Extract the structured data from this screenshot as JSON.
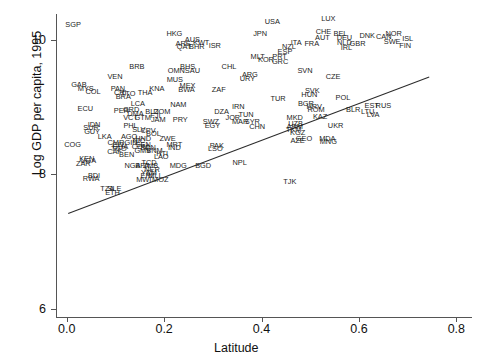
{
  "axes": {
    "xlabel": "Latitude",
    "ylabel": "Log GDP per capita, 1995",
    "xticks": [
      "0.0",
      "0.2",
      "0.4",
      "0.6",
      "0.8"
    ],
    "xtick_values": [
      0.0,
      0.2,
      0.4,
      0.6,
      0.8
    ],
    "yticks": [
      "6",
      "8",
      "10"
    ],
    "ytick_values": [
      6,
      8,
      10
    ],
    "xlim": [
      -0.02,
      0.83
    ],
    "ylim": [
      5.88,
      10.38
    ]
  },
  "chart_data": {
    "type": "scatter",
    "title": "",
    "xlabel": "Latitude",
    "ylabel": "Log GDP per capita, 1995",
    "xlim": [
      -0.02,
      0.83
    ],
    "ylim": [
      5.88,
      10.38
    ],
    "grid": false,
    "legend": null,
    "marker_style": "text-label",
    "annotation_note": "Each point is rendered as its 3-letter ISO country code instead of a marker.",
    "trendline": {
      "type": "linear-fit",
      "x_start": 0.003,
      "y_start": 7.42,
      "x_end": 0.745,
      "y_end": 9.45
    },
    "points": [
      {
        "label": "SGP",
        "x": 0.013,
        "y": 10.22
      },
      {
        "label": "HKG",
        "x": 0.221,
        "y": 10.09
      },
      {
        "label": "USA",
        "x": 0.422,
        "y": 10.26
      },
      {
        "label": "LUX",
        "x": 0.537,
        "y": 10.31
      },
      {
        "label": "CHE",
        "x": 0.527,
        "y": 10.11
      },
      {
        "label": "BEL",
        "x": 0.562,
        "y": 10.09
      },
      {
        "label": "NOR",
        "x": 0.671,
        "y": 10.09
      },
      {
        "label": "AUS",
        "x": 0.258,
        "y": 9.99
      },
      {
        "label": "JPN",
        "x": 0.397,
        "y": 10.08
      },
      {
        "label": "AUT",
        "x": 0.525,
        "y": 10.02
      },
      {
        "label": "DEU",
        "x": 0.57,
        "y": 10.02
      },
      {
        "label": "DNK",
        "x": 0.617,
        "y": 10.05
      },
      {
        "label": "CAN",
        "x": 0.651,
        "y": 10.04
      },
      {
        "label": "ISL",
        "x": 0.7,
        "y": 10.01
      },
      {
        "label": "ARE",
        "x": 0.239,
        "y": 9.94
      },
      {
        "label": "KWT",
        "x": 0.276,
        "y": 9.95
      },
      {
        "label": "ITA",
        "x": 0.471,
        "y": 9.95
      },
      {
        "label": "FRA",
        "x": 0.503,
        "y": 9.94
      },
      {
        "label": "NLD",
        "x": 0.57,
        "y": 9.95
      },
      {
        "label": "GBR",
        "x": 0.597,
        "y": 9.93
      },
      {
        "label": "SWE",
        "x": 0.668,
        "y": 9.96
      },
      {
        "label": "FIN",
        "x": 0.695,
        "y": 9.91
      },
      {
        "label": "QAT",
        "x": 0.241,
        "y": 9.89
      },
      {
        "label": "BHR",
        "x": 0.267,
        "y": 9.89
      },
      {
        "label": "ISR",
        "x": 0.304,
        "y": 9.9
      },
      {
        "label": "NZL",
        "x": 0.456,
        "y": 9.89
      },
      {
        "label": "IRL",
        "x": 0.574,
        "y": 9.87
      },
      {
        "label": "ESP",
        "x": 0.448,
        "y": 9.81
      },
      {
        "label": "MLT",
        "x": 0.392,
        "y": 9.74
      },
      {
        "label": "PRT",
        "x": 0.437,
        "y": 9.74
      },
      {
        "label": "KOR",
        "x": 0.409,
        "y": 9.7
      },
      {
        "label": "GRC",
        "x": 0.438,
        "y": 9.67
      },
      {
        "label": "BRB",
        "x": 0.144,
        "y": 9.6
      },
      {
        "label": "BHS",
        "x": 0.248,
        "y": 9.59
      },
      {
        "label": "CHL",
        "x": 0.333,
        "y": 9.59
      },
      {
        "label": "SVN",
        "x": 0.489,
        "y": 9.54
      },
      {
        "label": "CZE",
        "x": 0.547,
        "y": 9.44
      },
      {
        "label": "OMN",
        "x": 0.225,
        "y": 9.54
      },
      {
        "label": "SAU",
        "x": 0.258,
        "y": 9.54
      },
      {
        "label": "ARG",
        "x": 0.376,
        "y": 9.47
      },
      {
        "label": "URY",
        "x": 0.371,
        "y": 9.41
      },
      {
        "label": "VEN",
        "x": 0.099,
        "y": 9.45
      },
      {
        "label": "MUS",
        "x": 0.222,
        "y": 9.4
      },
      {
        "label": "GAB",
        "x": 0.025,
        "y": 9.32
      },
      {
        "label": "MYS",
        "x": 0.039,
        "y": 9.27
      },
      {
        "label": "COL",
        "x": 0.054,
        "y": 9.22
      },
      {
        "label": "PAN",
        "x": 0.105,
        "y": 9.26
      },
      {
        "label": "MEX",
        "x": 0.248,
        "y": 9.31
      },
      {
        "label": "BWA",
        "x": 0.246,
        "y": 9.25
      },
      {
        "label": "KNA",
        "x": 0.185,
        "y": 9.26
      },
      {
        "label": "ZAF",
        "x": 0.312,
        "y": 9.25
      },
      {
        "label": "SVK",
        "x": 0.504,
        "y": 9.24
      },
      {
        "label": "HUN",
        "x": 0.498,
        "y": 9.18
      },
      {
        "label": "CRI",
        "x": 0.11,
        "y": 9.2
      },
      {
        "label": "TTO",
        "x": 0.126,
        "y": 9.19
      },
      {
        "label": "THA",
        "x": 0.161,
        "y": 9.2
      },
      {
        "label": "POL",
        "x": 0.567,
        "y": 9.13
      },
      {
        "label": "BRA",
        "x": 0.116,
        "y": 9.14
      },
      {
        "label": "TUR",
        "x": 0.434,
        "y": 9.12
      },
      {
        "label": "BGR",
        "x": 0.491,
        "y": 9.04
      },
      {
        "label": "HRV",
        "x": 0.508,
        "y": 9.0
      },
      {
        "label": "EST",
        "x": 0.626,
        "y": 9.01
      },
      {
        "label": "RUS",
        "x": 0.65,
        "y": 9.02
      },
      {
        "label": "LCA",
        "x": 0.146,
        "y": 9.05
      },
      {
        "label": "NAM",
        "x": 0.229,
        "y": 9.03
      },
      {
        "label": "IRN",
        "x": 0.352,
        "y": 9.0
      },
      {
        "label": "ROM",
        "x": 0.512,
        "y": 8.96
      },
      {
        "label": "BLR",
        "x": 0.588,
        "y": 8.96
      },
      {
        "label": "LTU",
        "x": 0.618,
        "y": 8.93
      },
      {
        "label": "LVA",
        "x": 0.629,
        "y": 8.88
      },
      {
        "label": "ECU",
        "x": 0.038,
        "y": 8.97
      },
      {
        "label": "PER",
        "x": 0.112,
        "y": 8.94
      },
      {
        "label": "GRD",
        "x": 0.132,
        "y": 8.96
      },
      {
        "label": "BLZ",
        "x": 0.175,
        "y": 8.93
      },
      {
        "label": "DOM",
        "x": 0.195,
        "y": 8.93
      },
      {
        "label": "DZA",
        "x": 0.318,
        "y": 8.93
      },
      {
        "label": "KAZ",
        "x": 0.52,
        "y": 8.85
      },
      {
        "label": "DMA",
        "x": 0.141,
        "y": 8.89
      },
      {
        "label": "TUN",
        "x": 0.368,
        "y": 8.88
      },
      {
        "label": "MKD",
        "x": 0.468,
        "y": 8.83
      },
      {
        "label": "VCT",
        "x": 0.131,
        "y": 8.84
      },
      {
        "label": "GTM",
        "x": 0.156,
        "y": 8.84
      },
      {
        "label": "FJI",
        "x": 0.182,
        "y": 8.86
      },
      {
        "label": "JAM",
        "x": 0.188,
        "y": 8.8
      },
      {
        "label": "SWZ",
        "x": 0.296,
        "y": 8.78
      },
      {
        "label": "JOR",
        "x": 0.341,
        "y": 8.83
      },
      {
        "label": "MAR",
        "x": 0.356,
        "y": 8.78
      },
      {
        "label": "SYR",
        "x": 0.381,
        "y": 8.78
      },
      {
        "label": "PRY",
        "x": 0.233,
        "y": 8.8
      },
      {
        "label": "UZB",
        "x": 0.47,
        "y": 8.74
      },
      {
        "label": "ARM",
        "x": 0.468,
        "y": 8.7
      },
      {
        "label": "UKR",
        "x": 0.552,
        "y": 8.71
      },
      {
        "label": "PHL",
        "x": 0.131,
        "y": 8.72
      },
      {
        "label": "EGY",
        "x": 0.299,
        "y": 8.71
      },
      {
        "label": "CHN",
        "x": 0.391,
        "y": 8.7
      },
      {
        "label": "IDN",
        "x": 0.056,
        "y": 8.73
      },
      {
        "label": "SUR",
        "x": 0.05,
        "y": 8.68
      },
      {
        "label": "TKM",
        "x": 0.466,
        "y": 8.66
      },
      {
        "label": "GUY",
        "x": 0.052,
        "y": 8.63
      },
      {
        "label": "SLV",
        "x": 0.148,
        "y": 8.66
      },
      {
        "label": "CPV",
        "x": 0.167,
        "y": 8.64
      },
      {
        "label": "KGZ",
        "x": 0.474,
        "y": 8.62
      },
      {
        "label": "BOL",
        "x": 0.178,
        "y": 8.6
      },
      {
        "label": "LKA",
        "x": 0.078,
        "y": 8.56
      },
      {
        "label": "AGO",
        "x": 0.128,
        "y": 8.56
      },
      {
        "label": "HND",
        "x": 0.157,
        "y": 8.53
      },
      {
        "label": "ZWE",
        "x": 0.207,
        "y": 8.53
      },
      {
        "label": "GEO",
        "x": 0.487,
        "y": 8.52
      },
      {
        "label": "MDA",
        "x": 0.535,
        "y": 8.52
      },
      {
        "label": "AZE",
        "x": 0.474,
        "y": 8.49
      },
      {
        "label": "MNG",
        "x": 0.537,
        "y": 8.48
      },
      {
        "label": "COG",
        "x": 0.012,
        "y": 8.43
      },
      {
        "label": "CMR",
        "x": 0.101,
        "y": 8.47
      },
      {
        "label": "NIC",
        "x": 0.148,
        "y": 8.49
      },
      {
        "label": "GIN",
        "x": 0.132,
        "y": 8.47
      },
      {
        "label": "SEN",
        "x": 0.157,
        "y": 8.44
      },
      {
        "label": "CIV",
        "x": 0.106,
        "y": 8.43
      },
      {
        "label": "COM",
        "x": 0.151,
        "y": 8.41
      },
      {
        "label": "MRT",
        "x": 0.221,
        "y": 8.43
      },
      {
        "label": "PAK",
        "x": 0.308,
        "y": 8.42
      },
      {
        "label": "GHA",
        "x": 0.11,
        "y": 8.4
      },
      {
        "label": "SDN",
        "x": 0.167,
        "y": 8.39
      },
      {
        "label": "IND",
        "x": 0.221,
        "y": 8.39
      },
      {
        "label": "LSO",
        "x": 0.305,
        "y": 8.38
      },
      {
        "label": "TGO",
        "x": 0.107,
        "y": 8.37
      },
      {
        "label": "GMB",
        "x": 0.156,
        "y": 8.35
      },
      {
        "label": "VNM",
        "x": 0.18,
        "y": 8.34
      },
      {
        "label": "CAF",
        "x": 0.098,
        "y": 8.33
      },
      {
        "label": "HTI",
        "x": 0.196,
        "y": 8.3
      },
      {
        "label": "BEN",
        "x": 0.123,
        "y": 8.29
      },
      {
        "label": "LAO",
        "x": 0.194,
        "y": 8.26
      },
      {
        "label": "KEN",
        "x": 0.041,
        "y": 8.23
      },
      {
        "label": "UGA",
        "x": 0.044,
        "y": 8.19
      },
      {
        "label": "ZAR",
        "x": 0.034,
        "y": 8.15
      },
      {
        "label": "TCD",
        "x": 0.169,
        "y": 8.17
      },
      {
        "label": "NPL",
        "x": 0.355,
        "y": 8.17
      },
      {
        "label": "NGA",
        "x": 0.135,
        "y": 8.12
      },
      {
        "label": "BFA",
        "x": 0.155,
        "y": 8.12
      },
      {
        "label": "ZMB",
        "x": 0.172,
        "y": 8.12
      },
      {
        "label": "MDG",
        "x": 0.229,
        "y": 8.12
      },
      {
        "label": "BGD",
        "x": 0.28,
        "y": 8.12
      },
      {
        "label": "NER",
        "x": 0.175,
        "y": 8.07
      },
      {
        "label": "YEM",
        "x": 0.169,
        "y": 8.02
      },
      {
        "label": "ERI",
        "x": 0.164,
        "y": 7.98
      },
      {
        "label": "MLI",
        "x": 0.18,
        "y": 7.98
      },
      {
        "label": "BDI",
        "x": 0.056,
        "y": 7.97
      },
      {
        "label": "RWA",
        "x": 0.05,
        "y": 7.93
      },
      {
        "label": "MWI",
        "x": 0.158,
        "y": 7.91
      },
      {
        "label": "MOZ",
        "x": 0.192,
        "y": 7.91
      },
      {
        "label": "TJK",
        "x": 0.458,
        "y": 7.88
      },
      {
        "label": "TZA",
        "x": 0.083,
        "y": 7.78
      },
      {
        "label": "SLE",
        "x": 0.098,
        "y": 7.78
      },
      {
        "label": "ETH",
        "x": 0.094,
        "y": 7.72
      }
    ]
  }
}
